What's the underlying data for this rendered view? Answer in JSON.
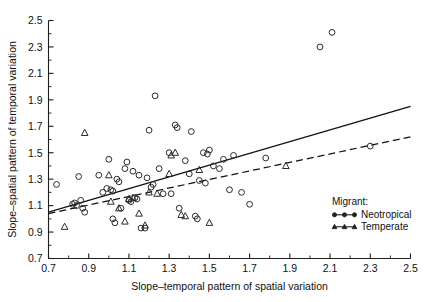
{
  "chart_data": {
    "type": "scatter",
    "title": "",
    "xlabel": "Slope–temporal pattern of spatial variation",
    "ylabel": "Slope–spatial pattern of temporal variation",
    "xlim": [
      0.7,
      2.5
    ],
    "ylim": [
      0.7,
      2.5
    ],
    "xticks": [
      "0.7",
      "0.9",
      "1.1",
      "1.3",
      "1.5",
      "1.7",
      "1.9",
      "2.1",
      "2.3",
      "2.5"
    ],
    "yticks": [
      "0.7",
      "0.9",
      "1.1",
      "1.3",
      "1.5",
      "1.7",
      "1.9",
      "2.1",
      "2.3",
      "2.5"
    ],
    "xtick_values": [
      0.7,
      0.9,
      1.1,
      1.3,
      1.5,
      1.7,
      1.9,
      2.1,
      2.3,
      2.5
    ],
    "ytick_values": [
      0.7,
      0.9,
      1.1,
      1.3,
      1.5,
      1.7,
      1.9,
      2.1,
      2.3,
      2.5
    ],
    "minor_tick_step": 0.1,
    "grid": false,
    "legend_position": "lower-right",
    "legend_title": "Migrant:",
    "series": [
      {
        "name": "Neotropical",
        "marker": "open-circle",
        "line_style": "solid",
        "points": [
          [
            0.74,
            1.26
          ],
          [
            0.82,
            1.11
          ],
          [
            0.83,
            1.12
          ],
          [
            0.84,
            1.1
          ],
          [
            0.85,
            1.32
          ],
          [
            0.86,
            1.14
          ],
          [
            0.87,
            1.08
          ],
          [
            0.88,
            1.05
          ],
          [
            0.95,
            1.33
          ],
          [
            0.97,
            1.2
          ],
          [
            0.99,
            1.23
          ],
          [
            1.0,
            1.45
          ],
          [
            1.01,
            1.22
          ],
          [
            1.02,
            1.21
          ],
          [
            1.02,
            1.0
          ],
          [
            1.03,
            0.97
          ],
          [
            1.04,
            1.3
          ],
          [
            1.05,
            1.28
          ],
          [
            1.06,
            1.08
          ],
          [
            1.08,
            1.38
          ],
          [
            1.09,
            1.43
          ],
          [
            1.1,
            1.14
          ],
          [
            1.11,
            1.13
          ],
          [
            1.12,
            1.36
          ],
          [
            1.13,
            1.16
          ],
          [
            1.14,
            1.15
          ],
          [
            1.15,
            1.33
          ],
          [
            1.16,
            0.93
          ],
          [
            1.18,
            0.93
          ],
          [
            1.19,
            1.31
          ],
          [
            1.2,
            1.67
          ],
          [
            1.21,
            1.24
          ],
          [
            1.22,
            1.26
          ],
          [
            1.23,
            1.93
          ],
          [
            1.25,
            1.38
          ],
          [
            1.27,
            1.19
          ],
          [
            1.3,
            1.5
          ],
          [
            1.31,
            1.19
          ],
          [
            1.33,
            1.71
          ],
          [
            1.34,
            1.69
          ],
          [
            1.35,
            1.08
          ],
          [
            1.38,
            1.44
          ],
          [
            1.4,
            1.34
          ],
          [
            1.41,
            1.66
          ],
          [
            1.43,
            1.02
          ],
          [
            1.44,
            1.0
          ],
          [
            1.45,
            1.29
          ],
          [
            1.47,
            1.5
          ],
          [
            1.48,
            1.27
          ],
          [
            1.49,
            1.49
          ],
          [
            1.5,
            1.52
          ],
          [
            1.52,
            1.4
          ],
          [
            1.55,
            1.38
          ],
          [
            1.57,
            1.45
          ],
          [
            1.6,
            1.22
          ],
          [
            1.62,
            1.48
          ],
          [
            1.66,
            1.2
          ],
          [
            1.7,
            1.11
          ],
          [
            1.78,
            1.46
          ],
          [
            2.05,
            2.3
          ],
          [
            2.11,
            2.41
          ],
          [
            2.3,
            1.55
          ]
        ]
      },
      {
        "name": "Temperate",
        "marker": "open-triangle",
        "line_style": "dashed",
        "points": [
          [
            0.78,
            0.94
          ],
          [
            0.88,
            1.65
          ],
          [
            1.0,
            1.33
          ],
          [
            1.01,
            1.13
          ],
          [
            1.05,
            1.08
          ],
          [
            1.08,
            0.98
          ],
          [
            1.1,
            1.15
          ],
          [
            1.12,
            1.16
          ],
          [
            1.15,
            1.04
          ],
          [
            1.18,
            0.95
          ],
          [
            1.2,
            1.2
          ],
          [
            1.24,
            1.19
          ],
          [
            1.3,
            1.34
          ],
          [
            1.31,
            1.48
          ],
          [
            1.33,
            1.5
          ],
          [
            1.36,
            1.03
          ],
          [
            1.38,
            1.02
          ],
          [
            1.45,
            1.37
          ],
          [
            1.5,
            0.97
          ],
          [
            1.88,
            1.4
          ]
        ]
      }
    ],
    "fit_lines": [
      {
        "series": "Neotropical",
        "style": "solid",
        "x_start": 0.7,
        "y_start": 1.05,
        "x_end": 2.5,
        "y_end": 1.85
      },
      {
        "series": "Temperate",
        "style": "dashed",
        "x_start": 0.7,
        "y_start": 1.04,
        "x_end": 2.5,
        "y_end": 1.62
      }
    ]
  },
  "legend": {
    "title": "Migrant:",
    "entries": [
      {
        "label": "Neotropical",
        "marker": "filled-circle",
        "line_style": "solid"
      },
      {
        "label": "Temperate",
        "marker": "filled-triangle",
        "line_style": "solid"
      }
    ]
  },
  "colors": {
    "axis": "#1c1c1c",
    "marker": "#2a2a2a",
    "fit_line": "#111111",
    "background": "#ffffff",
    "text": "#111111"
  }
}
